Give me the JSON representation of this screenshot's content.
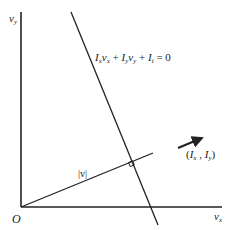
{
  "diagram": {
    "axes": {
      "y_label": "v",
      "y_sub": "y",
      "x_label": "v",
      "x_sub": "x",
      "origin_label": "O"
    },
    "constraint_line": {
      "eq_p1": "I",
      "eq_p1_sub": "x",
      "eq_p2": "v",
      "eq_p2_sub": "x",
      "eq_plus1": " + ",
      "eq_p3": "I",
      "eq_p3_sub": "y",
      "eq_p4": "v",
      "eq_p4_sub": "y",
      "eq_plus2": " + ",
      "eq_p5": "I",
      "eq_p5_sub": "t",
      "eq_eq": " = 0"
    },
    "normal_vector": {
      "label": "|v|"
    },
    "gradient": {
      "open": "(",
      "a": "I",
      "a_sub": "x",
      "comma": " , ",
      "b": "I",
      "b_sub": "y",
      "close": ")"
    },
    "colors": {
      "line": "#222222",
      "background": "#ffffff"
    }
  }
}
